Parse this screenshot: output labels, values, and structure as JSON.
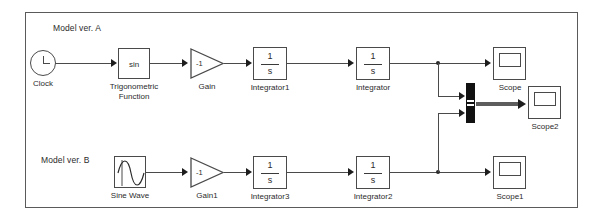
{
  "diagram": {
    "groups": [
      {
        "label": "Model ver. A"
      },
      {
        "label": "Model ver. B"
      }
    ]
  },
  "blocks": {
    "clock": {
      "label": "Clock",
      "icon": "clock-icon"
    },
    "trig": {
      "label_line1": "Trigonometric",
      "label_line2": "Function",
      "value": "sin"
    },
    "gain": {
      "label": "Gain",
      "value": "-1"
    },
    "integrator1": {
      "label": "Integrator1",
      "numerator": "1",
      "denominator": "s"
    },
    "integrator": {
      "label": "Integrator",
      "numerator": "1",
      "denominator": "s"
    },
    "scope": {
      "label": "Scope",
      "icon": "scope-icon"
    },
    "scope2": {
      "label": "Scope2",
      "icon": "scope-icon"
    },
    "sinewave": {
      "label": "Sine Wave",
      "icon": "sine-wave-icon"
    },
    "gain1": {
      "label": "Gain1",
      "value": "-1"
    },
    "integrator3": {
      "label": "Integrator3",
      "numerator": "1",
      "denominator": "s"
    },
    "integrator2": {
      "label": "Integrator2",
      "numerator": "1",
      "denominator": "s"
    },
    "scope1": {
      "label": "Scope1",
      "icon": "scope-icon"
    },
    "mux": {
      "label": "",
      "icon": "mux-icon",
      "inputs": 2
    }
  },
  "colors": {
    "frame_border": "#5a5a5a",
    "block_border": "#4a4a4a",
    "wire": "#4a4a4a",
    "bus": "#5d5d5d",
    "text": "#2b2b2b",
    "background": "#ffffff"
  }
}
